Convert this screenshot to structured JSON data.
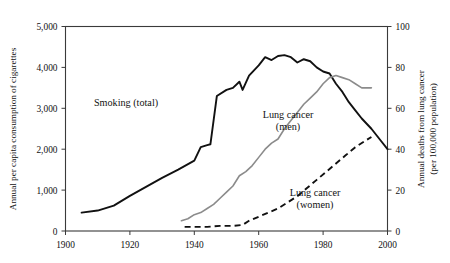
{
  "chart_data": {
    "type": "line",
    "title": "",
    "subtitle": "",
    "xlabel": "",
    "ylabel": "Annual per capita consumption of cigarettes",
    "ylabel_right_line1": "Annual deaths from lung cancer",
    "ylabel_right_line2": "(per 100,000 population)",
    "xlim": [
      1900,
      2000
    ],
    "ylim": [
      0,
      5000
    ],
    "ylim_right": [
      0,
      100
    ],
    "grid": false,
    "legend": "inline-annotations",
    "xticks": [
      1900,
      1920,
      1940,
      1960,
      1980,
      2000
    ],
    "xtick_labels": [
      "1900",
      "1920",
      "1940",
      "1960",
      "1980",
      "2000"
    ],
    "yticks": [
      0,
      1000,
      2000,
      3000,
      4000,
      5000
    ],
    "ytick_labels": [
      "0",
      "1,000",
      "2,000",
      "3,000",
      "4,000",
      "5,000"
    ],
    "yticks_right": [
      0,
      20,
      40,
      60,
      80,
      100
    ],
    "ytick_labels_right": [
      "0",
      "20",
      "40",
      "60",
      "80",
      "100"
    ],
    "series": [
      {
        "name": "Smoking (total)",
        "axis": "left",
        "style": "solid",
        "color": "#111111",
        "label_x": 1930,
        "label_y": 3050,
        "x": [
          1905,
          1910,
          1915,
          1920,
          1925,
          1930,
          1935,
          1940,
          1942,
          1944,
          1945,
          1947,
          1950,
          1952,
          1954,
          1955,
          1957,
          1960,
          1962,
          1964,
          1966,
          1968,
          1970,
          1972,
          1974,
          1976,
          1978,
          1980,
          1982,
          1984,
          1986,
          1988,
          1990,
          1992,
          1995,
          1998,
          2000
        ],
        "values": [
          450,
          500,
          620,
          860,
          1080,
          1300,
          1500,
          1720,
          2050,
          2100,
          2120,
          3300,
          3450,
          3500,
          3650,
          3450,
          3800,
          4050,
          4250,
          4180,
          4280,
          4300,
          4250,
          4120,
          4200,
          4150,
          4000,
          3900,
          3850,
          3600,
          3400,
          3150,
          2950,
          2750,
          2500,
          2200,
          2000
        ]
      },
      {
        "name": "Lung cancer (men)",
        "axis": "right",
        "style": "solid",
        "color": "#8b8b8b",
        "label_x": 1964,
        "label_y_right": 38,
        "x": [
          1936,
          1938,
          1940,
          1942,
          1944,
          1946,
          1948,
          1950,
          1952,
          1954,
          1956,
          1958,
          1960,
          1962,
          1964,
          1966,
          1968,
          1970,
          1972,
          1974,
          1976,
          1978,
          1980,
          1982,
          1984,
          1986,
          1988,
          1990,
          1992,
          1995
        ],
        "values": [
          5,
          6,
          8,
          9,
          11,
          13,
          16,
          19,
          22,
          27,
          29,
          32,
          36,
          40,
          43,
          45,
          50,
          54,
          58,
          62,
          65,
          68,
          72,
          75,
          76,
          75,
          74,
          72,
          70,
          70
        ]
      },
      {
        "name": "Lung cancer (women)",
        "axis": "right",
        "style": "dashed",
        "color": "#111111",
        "label_x": 1975,
        "label_y_right": 16,
        "x": [
          1937,
          1940,
          1944,
          1948,
          1952,
          1955,
          1957,
          1960,
          1963,
          1966,
          1969,
          1972,
          1975,
          1978,
          1981,
          1984,
          1987,
          1990,
          1993,
          1995
        ],
        "values": [
          2,
          2,
          2,
          2.5,
          2.5,
          3,
          5,
          7,
          9,
          11,
          14,
          17,
          21,
          25,
          29,
          33,
          37,
          41,
          44,
          46
        ]
      }
    ]
  },
  "annotations": {
    "smoking_label": "Smoking (total)",
    "men_label_line1": "Lung cancer",
    "men_label_line2": "(men)",
    "women_label_line1": "Lung cancer",
    "women_label_line2": "(women)"
  },
  "colors": {
    "smoking": "#111111",
    "lung_cancer_men": "#8b8b8b",
    "lung_cancer_women": "#111111",
    "frame": "#3a3a3a",
    "background": "#ffffff"
  }
}
